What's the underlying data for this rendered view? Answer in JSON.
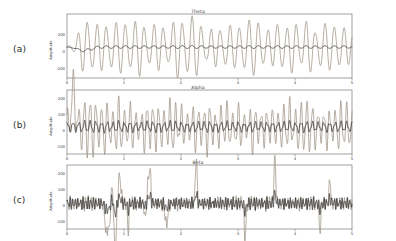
{
  "figure": {
    "background_color": "#ffffff",
    "panel_count": 3,
    "row_labels": [
      "(a)",
      "(b)",
      "(c)"
    ]
  },
  "chart_data": [
    {
      "type": "line",
      "title": "Theta",
      "row_label": "(a)",
      "xlabel": "",
      "ylabel": "Amplitude",
      "xlim": [
        0,
        5
      ],
      "ylim": [
        -300,
        320
      ],
      "xticks": [
        "0",
        "1",
        "2",
        "3",
        "4",
        "5"
      ],
      "yticks": [
        "200",
        "0",
        "-200"
      ],
      "grid": false,
      "legend": "none",
      "series": [
        {
          "name": "theta-oscillation",
          "color": "#9c9183",
          "description": "large amplitude slow oscillation, ~6 Hz theta band",
          "frequency_hz": 6,
          "amplitude_peak": 300
        },
        {
          "name": "theta-reference",
          "color": "#2f2f2f",
          "description": "low amplitude dark reference trace near zero",
          "frequency_hz": 6,
          "amplitude_peak": 25
        }
      ]
    },
    {
      "type": "line",
      "title": "Alpha",
      "row_label": "(b)",
      "xlabel": "",
      "ylabel": "Amplitude",
      "xlim": [
        0,
        5
      ],
      "ylim": [
        -170,
        230
      ],
      "xticks": [
        "0",
        "1",
        "2",
        "3",
        "4",
        "5"
      ],
      "yticks": [
        "200",
        "100",
        "0",
        "-100"
      ],
      "grid": false,
      "legend": "none",
      "series": [
        {
          "name": "alpha-oscillation",
          "color": "#9c9183",
          "description": "medium amplitude oscillation, ~10 Hz alpha band",
          "frequency_hz": 10,
          "amplitude_peak": 210
        },
        {
          "name": "alpha-reference",
          "color": "#2f2f2f",
          "description": "low amplitude dark reference trace near zero",
          "frequency_hz": 10,
          "amplitude_peak": 35
        }
      ]
    },
    {
      "type": "line",
      "title": "Beta",
      "row_label": "(c)",
      "xlabel": "",
      "ylabel": "Amplitude",
      "xlim": [
        0,
        5
      ],
      "ylim": [
        -160,
        240
      ],
      "xticks": [
        "0",
        "1",
        "2",
        "3",
        "4",
        "5"
      ],
      "yticks": [
        "200",
        "100",
        "0",
        "-100"
      ],
      "grid": false,
      "legend": "none",
      "series": [
        {
          "name": "beta-oscillation",
          "color": "#9c9183",
          "description": "high frequency low amplitude oscillation with intermittent bursts, ~22 Hz beta band",
          "frequency_hz": 22,
          "amplitude_peak": 220
        },
        {
          "name": "beta-reference",
          "color": "#2f2f2f",
          "description": "dark dense high frequency reference trace near zero",
          "frequency_hz": 22,
          "amplitude_peak": 45
        }
      ]
    }
  ]
}
